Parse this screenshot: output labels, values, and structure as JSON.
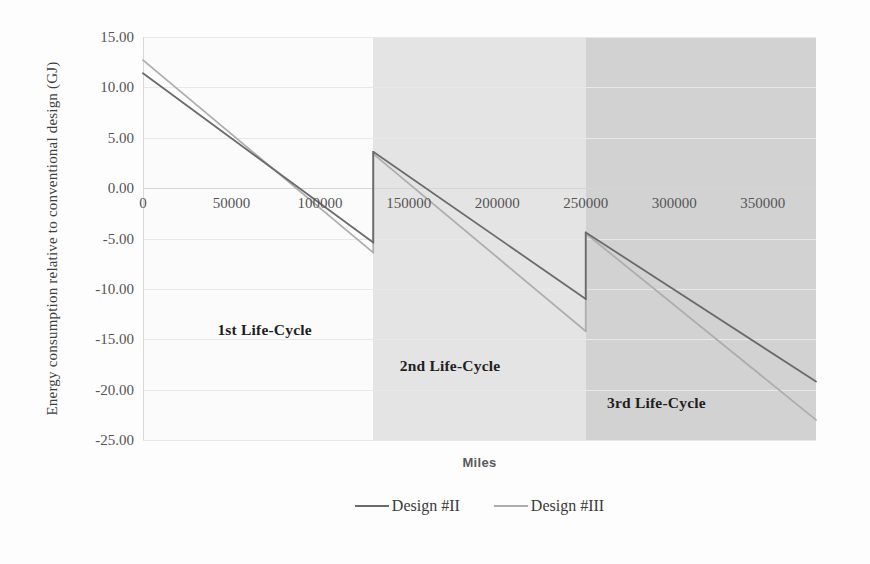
{
  "chart_data": {
    "type": "line",
    "title": "",
    "subtitle": "",
    "xlabel": "Miles",
    "ylabel": "Energy consumption relative to conventional design (GJ)",
    "xlim": [
      0,
      380000
    ],
    "ylim": [
      -25.0,
      15.0
    ],
    "grid": true,
    "legend_position": "bottom-center",
    "x_ticks": [
      "0",
      "50000",
      "100000",
      "150000",
      "200000",
      "250000",
      "300000",
      "350000"
    ],
    "x_tick_values": [
      0,
      50000,
      100000,
      150000,
      200000,
      250000,
      300000,
      350000
    ],
    "y_ticks": [
      "15.00",
      "10.00",
      "5.00",
      "0.00",
      "-5.00",
      "-10.00",
      "-15.00",
      "-20.00",
      "-25.00"
    ],
    "y_tick_values": [
      15.0,
      10.0,
      5.0,
      0.0,
      -5.0,
      -10.0,
      -15.0,
      -20.0,
      -25.0
    ],
    "series": [
      {
        "name": "Design #II",
        "color": "#6b6b6b",
        "segments": [
          {
            "x": [
              0,
              130000
            ],
            "y": [
              11.4,
              -5.4
            ]
          },
          {
            "x": [
              130000,
              250000
            ],
            "y": [
              3.6,
              -11.0
            ]
          },
          {
            "x": [
              250000,
              380000
            ],
            "y": [
              -4.4,
              -19.2
            ]
          }
        ]
      },
      {
        "name": "Design #III",
        "color": "#aeaeae",
        "segments": [
          {
            "x": [
              0,
              130000
            ],
            "y": [
              12.7,
              -6.4
            ]
          },
          {
            "x": [
              130000,
              250000
            ],
            "y": [
              3.4,
              -14.2
            ]
          },
          {
            "x": [
              250000,
              380000
            ],
            "y": [
              -4.5,
              -23.0
            ]
          }
        ]
      }
    ],
    "annotations": [
      {
        "text": "1st Life-Cycle",
        "x": 42000,
        "y": -13.2
      },
      {
        "text": "2nd Life-Cycle",
        "x": 145000,
        "y": -16.8
      },
      {
        "text": "3rd Life-Cycle",
        "x": 262000,
        "y": -20.4
      }
    ],
    "background_bands": [
      {
        "label": "1st Life-Cycle",
        "x_start": 0,
        "x_end": 130000,
        "color": "#fbfbfb"
      },
      {
        "label": "2nd Life-Cycle",
        "x_start": 130000,
        "x_end": 250000,
        "color": "#e4e4e4"
      },
      {
        "label": "3rd Life-Cycle",
        "x_start": 250000,
        "x_end": 380000,
        "color": "#d2d2d2"
      }
    ]
  },
  "axes": {
    "y_title": "Energy consumption relative to conventional design (GJ)",
    "x_title": "Miles"
  },
  "legend": {
    "items": [
      {
        "label": "Design #II",
        "color": "#6b6b6b"
      },
      {
        "label": "Design #III",
        "color": "#aeaeae"
      }
    ]
  }
}
